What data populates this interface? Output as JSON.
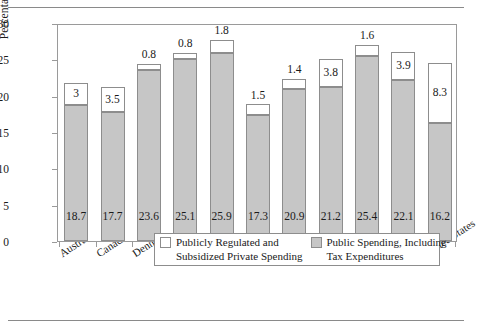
{
  "chart_data": {
    "type": "bar",
    "stacked": true,
    "title": "",
    "xlabel": "",
    "ylabel": "Percentage of GDP",
    "ylim": [
      0,
      30
    ],
    "yticks": [
      0,
      5,
      10,
      15,
      20,
      25,
      30
    ],
    "grid": false,
    "legend_position": "inside-bottom-center",
    "categories": [
      "Australia",
      "Canada",
      "Denmark",
      "Finland",
      "Germany",
      "Ireland",
      "Italy",
      "Netherlands",
      "Sweden",
      "United Kingdom",
      "United States"
    ],
    "series": [
      {
        "name": "Public Spending, Including Tax Expenditures",
        "color": "#c6c6c6",
        "values": [
          18.7,
          17.7,
          23.6,
          25.1,
          25.9,
          17.3,
          20.9,
          21.2,
          25.4,
          22.1,
          16.2
        ]
      },
      {
        "name": "Publicly Regulated and Subsidized Private Spending",
        "color": "#ffffff",
        "values": [
          3,
          3.5,
          0.8,
          0.8,
          1.8,
          1.5,
          1.4,
          3.8,
          1.6,
          3.9,
          8.3
        ]
      }
    ],
    "value_labels": {
      "public": [
        "18.7",
        "17.7",
        "23.6",
        "25.1",
        "25.9",
        "17.3",
        "20.9",
        "21.2",
        "25.4",
        "22.1",
        "16.2"
      ],
      "private": [
        "3",
        "3.5",
        "0.8",
        "0.8",
        "1.8",
        "1.5",
        "1.4",
        "3.8",
        "1.6",
        "3.9",
        "8.3"
      ],
      "private_label_placement": [
        "inside",
        "inside",
        "above",
        "above",
        "inside",
        "above",
        "above",
        "inside",
        "above",
        "inside",
        "inside"
      ]
    },
    "totals": [
      21.7,
      21.2,
      24.4,
      25.9,
      27.7,
      18.8,
      22.3,
      25.0,
      27.0,
      26.0,
      24.5
    ]
  },
  "legend": {
    "items": [
      {
        "swatch": "white",
        "line1": "Publicly Regulated and",
        "line2": "Subsidized Private Spending"
      },
      {
        "swatch": "gray",
        "line1": "Public Spending, Including",
        "line2": "Tax Expenditures"
      }
    ]
  },
  "colors": {
    "bar_public": "#c6c6c6",
    "bar_private": "#ffffff",
    "outline": "#8d8d8d",
    "axis": "#9a9a9a",
    "text": "#1a1a1a"
  }
}
